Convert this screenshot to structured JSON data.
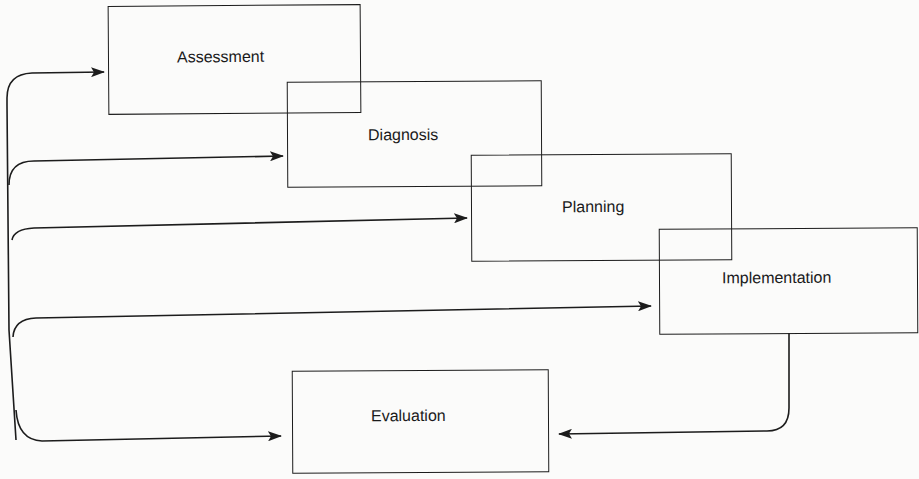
{
  "diagram": {
    "type": "nursing-process-flow",
    "colors": {
      "stroke": "#1c1c1c",
      "background": "#fbfbfa",
      "text": "#1a1a1a"
    },
    "boxes": [
      {
        "id": "assessment",
        "label": "Assessment"
      },
      {
        "id": "diagnosis",
        "label": "Diagnosis"
      },
      {
        "id": "planning",
        "label": "Planning"
      },
      {
        "id": "implementation",
        "label": "Implementation"
      },
      {
        "id": "evaluation",
        "label": "Evaluation"
      }
    ],
    "connections": [
      {
        "from": "evaluation-feedback",
        "to": "assessment"
      },
      {
        "from": "evaluation-feedback",
        "to": "diagnosis"
      },
      {
        "from": "evaluation-feedback",
        "to": "planning"
      },
      {
        "from": "evaluation-feedback",
        "to": "implementation"
      },
      {
        "from": "evaluation-feedback",
        "to": "evaluation"
      },
      {
        "from": "implementation",
        "to": "evaluation"
      }
    ]
  }
}
